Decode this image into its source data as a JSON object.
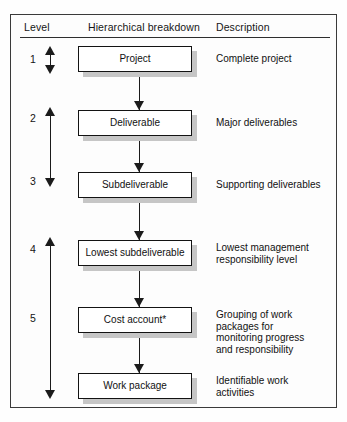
{
  "figure": {
    "columns": {
      "level": "Level",
      "hierarchy": "Hierarchical breakdown",
      "description": "Description"
    },
    "levels": [
      {
        "number": "1"
      },
      {
        "number": "2"
      },
      {
        "number": "3"
      },
      {
        "number": "4"
      },
      {
        "number": "5"
      }
    ],
    "nodes": [
      {
        "label": "Project"
      },
      {
        "label": "Deliverable"
      },
      {
        "label": "Subdeliverable"
      },
      {
        "label": "Lowest subdeliverable"
      },
      {
        "label": "Cost account*"
      },
      {
        "label": "Work package"
      }
    ],
    "descriptions": [
      {
        "lines": [
          "Complete project"
        ]
      },
      {
        "lines": [
          "Major deliverables"
        ]
      },
      {
        "lines": [
          "Supporting deliverables"
        ]
      },
      {
        "lines": [
          "Lowest management",
          "responsibility level"
        ]
      },
      {
        "lines": [
          "Grouping of work",
          "packages for",
          "monitoring progress",
          "and responsibility"
        ]
      },
      {
        "lines": [
          "Identifiable work",
          "activities"
        ]
      }
    ],
    "colors": {
      "frame": "#3a3a3a",
      "box_border": "#131313",
      "box_shadow": "#c6c6c6",
      "arrow": "#1b1b1b",
      "text": "#111111",
      "background": "#fdfdfd"
    }
  }
}
